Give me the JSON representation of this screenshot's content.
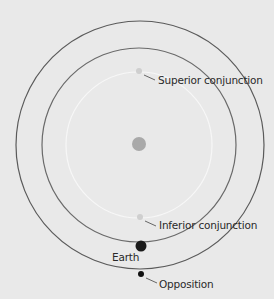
{
  "diagram": {
    "labels": {
      "superior": "Superior conjunction",
      "inferior": "Inferior conjunction",
      "earth": "Earth",
      "opposition": "Opposition"
    },
    "colors": {
      "background": "#e9e9e9",
      "outer_orbit": "#5a5a5a",
      "middle_orbit": "#6a6a6a",
      "inner_orbit": "#f7f7f7",
      "sun": "#a9a9a9",
      "inner_planet": "#cfcfcf",
      "earth": "#1a1a1a",
      "outer_planet": "#111111"
    }
  }
}
